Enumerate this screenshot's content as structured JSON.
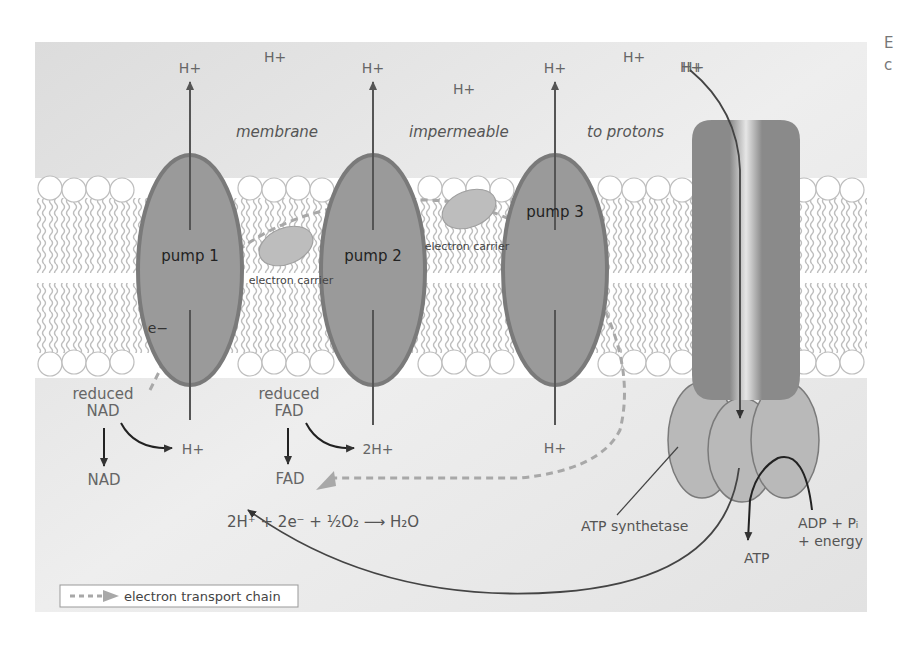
{
  "figure": {
    "side_text": [
      "E",
      "c"
    ],
    "top_labels": {
      "italic_caption": [
        "membrane",
        "impermeable",
        "to protons"
      ],
      "protons_outside": [
        "H+",
        "H+",
        "H+",
        "H+",
        "H+",
        "H+",
        "H+"
      ]
    },
    "pumps": [
      {
        "label": "pump 1",
        "top": "H+",
        "bottom": "H+"
      },
      {
        "label": "pump 2",
        "top": "H+",
        "bottom": "2H+"
      },
      {
        "label": "pump 3",
        "top": "H+",
        "bottom": "H+"
      }
    ],
    "electron_carriers": [
      "electron carrier",
      "electron carrier"
    ],
    "electron_label": "e−",
    "reduced_nad": {
      "line1": "reduced",
      "line2": "NAD",
      "product": "NAD"
    },
    "reduced_fad": {
      "line1": "reduced",
      "line2": "FAD",
      "product": "FAD"
    },
    "equation": "2H⁺ + 2e⁻ + ½O₂ ⟶ H₂O",
    "atp_synthetase": {
      "label": "ATP synthetase",
      "inflow": "H+",
      "product": "ATP",
      "input_line1": "ADP + Pᵢ",
      "input_line2": "+ energy"
    },
    "legend": {
      "label": "electron transport chain"
    }
  }
}
